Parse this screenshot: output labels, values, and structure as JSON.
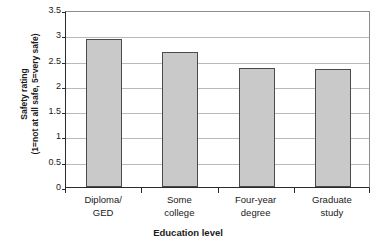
{
  "chart_data": {
    "type": "bar",
    "title": "",
    "xlabel": "Education level",
    "ylabel_line1": "Safety rating",
    "ylabel_line2": "(1=not at all safe, 5=very safe)",
    "categories": [
      "Diploma/ GED",
      "Some college",
      "Four-year degree",
      "Graduate study"
    ],
    "category_lines": [
      [
        "Diploma/",
        "GED"
      ],
      [
        "Some",
        "college"
      ],
      [
        "Four-year",
        "degree"
      ],
      [
        "Graduate",
        "study"
      ]
    ],
    "values": [
      2.93,
      2.66,
      2.35,
      2.34
    ],
    "ylim": [
      0,
      3.5
    ],
    "yticks": [
      3.5,
      3,
      2.5,
      2,
      1.5,
      1,
      0.5,
      0
    ],
    "ytick_labels": [
      "3.5",
      "3",
      "2.5",
      "2",
      "1.5",
      "1",
      "0.5",
      "0"
    ],
    "grid": true,
    "legend": false,
    "bar_color": "#c9c9c9",
    "bar_border_color": "#4a4a4a",
    "axis_color": "#2b2b2b",
    "grid_color": "#b9b9b9"
  }
}
